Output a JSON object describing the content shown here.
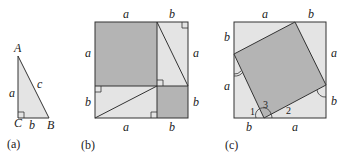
{
  "colors": {
    "light_fill": "#e4e4e4",
    "dark_fill": "#b4b4b4",
    "stroke": "#333333",
    "background": "#ffffff"
  },
  "panel_a": {
    "caption": "(a)",
    "vertices": {
      "A": "A",
      "B": "B",
      "C": "C"
    },
    "sides": {
      "a": "a",
      "b": "b",
      "c": "c"
    }
  },
  "panel_b": {
    "caption": "(b)",
    "top_labels": [
      "a",
      "b"
    ],
    "bottom_labels": [
      "a",
      "b"
    ],
    "left_labels": [
      "a",
      "b"
    ],
    "right_labels": [
      "a",
      "b"
    ]
  },
  "panel_c": {
    "caption": "(c)",
    "top_labels": [
      "a",
      "b"
    ],
    "bottom_labels": [
      "b",
      "a"
    ],
    "left_labels": [
      "b",
      "a"
    ],
    "right_labels": [
      "a",
      "b"
    ],
    "angle_labels": [
      "1",
      "3",
      "2"
    ]
  }
}
